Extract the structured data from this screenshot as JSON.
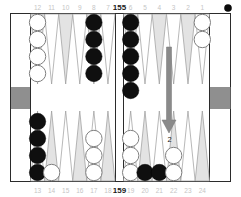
{
  "board": {
    "top_point_labels_left": [
      "12",
      "11",
      "10",
      "9",
      "8",
      "7"
    ],
    "top_point_labels_right": [
      "6",
      "5",
      "4",
      "3",
      "2",
      "1"
    ],
    "bottom_point_labels_left": [
      "13",
      "14",
      "15",
      "16",
      "17",
      "18"
    ],
    "bottom_point_labels_right": [
      "19",
      "20",
      "21",
      "22",
      "23",
      "24"
    ],
    "pip_count_top": "155",
    "pip_count_bottom": "159",
    "on_roll": "black",
    "move_arrow": {
      "label": "2",
      "to_point": "22"
    },
    "checkers": [
      {
        "point": "12",
        "row": "top",
        "half": "left",
        "col": 0,
        "count": 4,
        "color": "white"
      },
      {
        "point": "8",
        "row": "top",
        "half": "left",
        "col": 4,
        "count": 4,
        "color": "black"
      },
      {
        "point": "6",
        "row": "top",
        "half": "right",
        "col": 0,
        "count": 5,
        "color": "black"
      },
      {
        "point": "1",
        "row": "top",
        "half": "right",
        "col": 5,
        "count": 2,
        "color": "white"
      },
      {
        "point": "13",
        "row": "bottom",
        "half": "left",
        "col": 0,
        "count": 4,
        "color": "black"
      },
      {
        "point": "14",
        "row": "bottom",
        "half": "left",
        "col": 1,
        "count": 1,
        "color": "white"
      },
      {
        "point": "17",
        "row": "bottom",
        "half": "left",
        "col": 4,
        "count": 3,
        "color": "white"
      },
      {
        "point": "19",
        "row": "bottom",
        "half": "right",
        "col": 0,
        "count": 3,
        "color": "white"
      },
      {
        "point": "20",
        "row": "bottom",
        "half": "right",
        "col": 1,
        "count": 1,
        "color": "black"
      },
      {
        "point": "21",
        "row": "bottom",
        "half": "right",
        "col": 2,
        "count": 1,
        "color": "black"
      },
      {
        "point": "22",
        "row": "bottom",
        "half": "right",
        "col": 3,
        "count": 2,
        "color": "white"
      }
    ]
  },
  "colors": {
    "frame": "#2b2b2b",
    "point_dark": "#e3e3e3",
    "point_light": "#ffffff",
    "point_outline": "#9a9a9a",
    "tray_block": "#8f8f8f",
    "checker_black": "#0f0f0f",
    "checker_white": "#ffffff",
    "checker_white_outline": "#808080",
    "arrow": "#8a8a8a",
    "label_gray": "#c5c5c5",
    "label_dark": "#1a1a1a"
  }
}
